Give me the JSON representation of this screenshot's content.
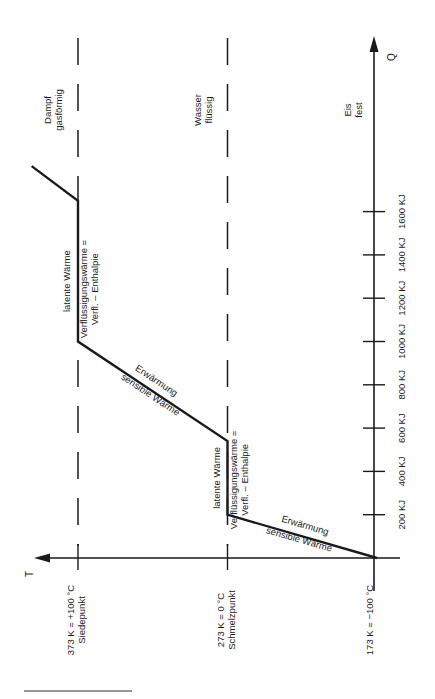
{
  "chart_data": {
    "type": "line",
    "title": "",
    "orientation": "rotated-90-ccw",
    "xlabel": "Q",
    "ylabel": "T",
    "x_unit": "KJ",
    "x_ticks": [
      200,
      400,
      600,
      800,
      1000,
      1200,
      1400,
      1600
    ],
    "x_tick_labels": [
      "200 KJ",
      "400 KJ",
      "600 KJ",
      "800 KJ",
      "1000 KJ",
      "1200 KJ",
      "1400 KJ",
      "1600 KJ"
    ],
    "xlim": [
      0,
      1800
    ],
    "y_ticks": [
      173,
      273,
      373
    ],
    "y_tick_labels": [
      [
        "173 K = −100 °C",
        ""
      ],
      [
        "273 K = 0 °C",
        "Schmelzpunkt"
      ],
      [
        "373 K = +100 °C",
        "Siedepunkt"
      ]
    ],
    "ylim": [
      173,
      420
    ],
    "series": [
      {
        "name": "Heating curve of water",
        "x": [
          0,
          200,
          540,
          1000,
          1650,
          1810
        ],
        "y": [
          173,
          273,
          273,
          373,
          373,
          404
        ]
      }
    ],
    "phase_lines": [
      273,
      373
    ],
    "phase_labels": [
      {
        "line1": "Eis",
        "line2": "fest",
        "at_T": 173
      },
      {
        "line1": "Wasser",
        "line2": "flüssig",
        "at_T": 273
      },
      {
        "line1": "Dampf",
        "line2": "gasförmig",
        "at_T": 373
      }
    ],
    "annotations": {
      "sensible_1_top": "Erwärmung",
      "sensible_1_bottom": "sensible Wärme",
      "latent_1_left": "latente Wärme",
      "latent_1_right_1": "Verflüssigungswärme =",
      "latent_1_right_2": "Verfl. – Enthalpie",
      "sensible_2_top": "Erwärmung",
      "sensible_2_bottom": "sensible Wärme",
      "latent_2_left": "latente Wärme",
      "latent_2_right_1": "Verflüssigungswärme =",
      "latent_2_right_2": "Verfl. – Enthalpie"
    },
    "grid": false,
    "legend": "none"
  },
  "colors": {
    "ink": "#1a1a1a",
    "background": "#ffffff"
  }
}
